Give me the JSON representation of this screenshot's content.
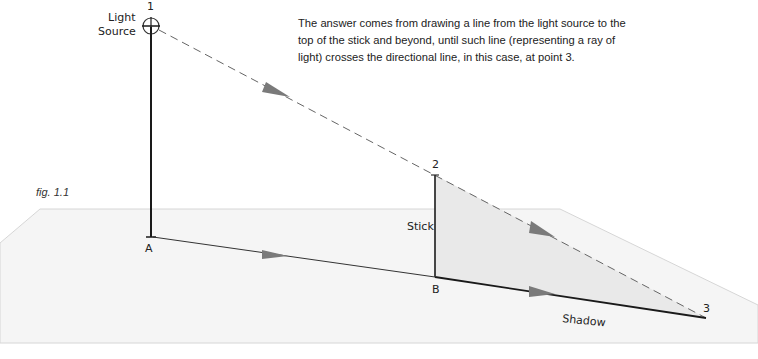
{
  "figure": {
    "label": "fig. 1.1",
    "caption": "The answer comes from drawing a line from the light source to the top of the stick and beyond, until such line (representing a ray of light) crosses the directional line, in this case, at point 3."
  },
  "points": {
    "p1": "1",
    "p2": "2",
    "p3": "3",
    "a": "A",
    "b": "B"
  },
  "labels": {
    "light_source_line1": "Light",
    "light_source_line2": "Source",
    "stick": "Stick",
    "shadow": "Shadow"
  },
  "colors": {
    "ground_plane": "#f4f4f4",
    "shadow_fill": "#ebebeb",
    "line": "#222222",
    "dashed_ray": "#666666",
    "arrow": "#777777"
  }
}
